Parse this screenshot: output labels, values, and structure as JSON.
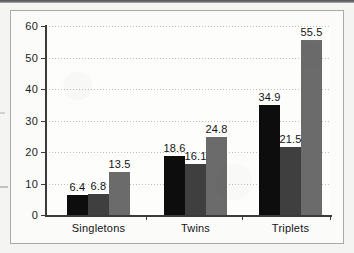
{
  "chart_data": {
    "type": "bar",
    "title": "",
    "subtitle": "",
    "xlabel": "",
    "ylabel": "",
    "categories": [
      "Singletons",
      "Twins",
      "Triplets"
    ],
    "series": [
      {
        "name": "series-1",
        "color": "#0d0d0d",
        "values": [
          6.4,
          6.8,
          13.5
        ]
      },
      {
        "name": "series-2",
        "color": "#3f3f3f",
        "values": [
          18.6,
          16.1,
          24.8
        ]
      },
      {
        "name": "series-3",
        "color": "#6b6b6b",
        "values": [
          34.9,
          21.5,
          55.5
        ]
      }
    ],
    "grouped_values": [
      {
        "category": "Singletons",
        "bars": [
          6.4,
          6.8,
          13.5
        ]
      },
      {
        "category": "Twins",
        "bars": [
          18.6,
          16.1,
          24.8
        ]
      },
      {
        "category": "Triplets",
        "bars": [
          34.9,
          21.5,
          55.5
        ]
      }
    ],
    "bar_labels": [
      "6.4",
      "6.8",
      "13.5",
      "18.6",
      "16.1",
      "24.8",
      "34.9",
      "21.5",
      "55.5"
    ],
    "ylim": [
      0,
      60
    ],
    "ytick_values": [
      0,
      10,
      20,
      30,
      40,
      50,
      60
    ],
    "ytick_labels": [
      "0",
      "10",
      "20",
      "30",
      "40",
      "50",
      "60"
    ],
    "grid": "horizontal-dotted",
    "legend": "none",
    "legend_position": "none",
    "bar_colors": [
      "#0d0d0d",
      "#3f3f3f",
      "#6b6b6b"
    ],
    "axis_color": "#3a3a3a",
    "gridline_color": "#bfc0bd",
    "plot_background": "#fdfdfc",
    "page_background": "#f4f4f2",
    "frame_color": "#a9aaa7"
  }
}
